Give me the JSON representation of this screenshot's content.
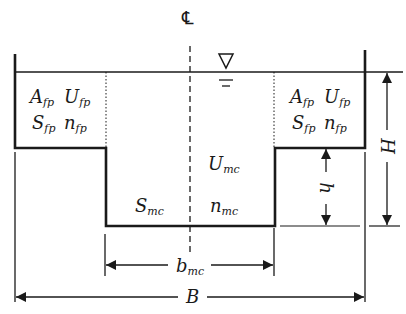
{
  "diagram": {
    "centerline_symbol": "℄",
    "water_surface_symbol": "∇",
    "colors": {
      "line": "#1a1a1a",
      "background": "#ffffff"
    },
    "left_floodplain": {
      "row1": [
        {
          "base": "A",
          "sub": "fp"
        },
        {
          "base": "U",
          "sub": "fp"
        }
      ],
      "row2": [
        {
          "base": "S",
          "sub": "fp"
        },
        {
          "base": "n",
          "sub": "fp"
        }
      ]
    },
    "right_floodplain": {
      "row1": [
        {
          "base": "A",
          "sub": "fp"
        },
        {
          "base": "U",
          "sub": "fp"
        }
      ],
      "row2": [
        {
          "base": "S",
          "sub": "fp"
        },
        {
          "base": "n",
          "sub": "fp"
        }
      ]
    },
    "main_channel": {
      "velocity": {
        "base": "U",
        "sub": "mc"
      },
      "slope": {
        "base": "S",
        "sub": "mc"
      },
      "roughness": {
        "base": "n",
        "sub": "mc"
      }
    },
    "dimensions": {
      "total_depth": "H",
      "bankfull_depth": "h",
      "main_channel_width": {
        "base": "b",
        "sub": "mc"
      },
      "total_width": "B"
    }
  }
}
